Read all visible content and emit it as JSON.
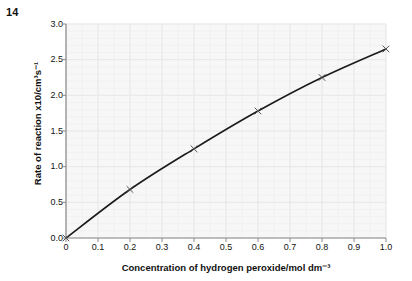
{
  "question": {
    "number": "14"
  },
  "top_cropped_text": "",
  "chart_data": {
    "type": "line",
    "title": "",
    "xlabel": "Concentration of hydrogen peroxide/mol dm⁻³",
    "ylabel": "Rate of reaction x10/cm³s⁻¹",
    "xlim": [
      0,
      1.0
    ],
    "ylim": [
      0,
      3.0
    ],
    "xticks": [
      0,
      0.1,
      0.2,
      0.3,
      0.4,
      0.5,
      0.6,
      0.7,
      0.8,
      0.9,
      1.0
    ],
    "xtick_labels": [
      "0",
      "0.1",
      "0.2",
      "0.3",
      "0.4",
      "0.5",
      "0.6",
      "0.7",
      "0.8",
      "0.9",
      "1.0"
    ],
    "yticks": [
      0.0,
      0.5,
      1.0,
      1.5,
      2.0,
      2.5,
      3.0
    ],
    "ytick_labels": [
      "0.0",
      "0.5",
      "1.0",
      "1.5",
      "2.0",
      "2.5",
      "3.0"
    ],
    "grid": true,
    "grid_minor": true,
    "legend": null,
    "marker": "x",
    "line_color": "#1a1a1a",
    "marker_color": "#555555",
    "grid_color": "#e8e8e8",
    "plot_bg": "#f7f7f7",
    "axis_color": "#8a8a8a",
    "x": [
      0,
      0.2,
      0.4,
      0.6,
      0.8,
      1.0
    ],
    "y": [
      0.0,
      0.68,
      1.25,
      1.78,
      2.25,
      2.65
    ],
    "series": [
      {
        "name": "Rate of reaction",
        "x": [
          0,
          0.2,
          0.4,
          0.6,
          0.8,
          1.0
        ],
        "values": [
          0.0,
          0.68,
          1.25,
          1.78,
          2.25,
          2.65
        ]
      }
    ]
  },
  "plot_geometry": {
    "left": 66,
    "right": 386,
    "top": 24,
    "bottom": 238
  }
}
